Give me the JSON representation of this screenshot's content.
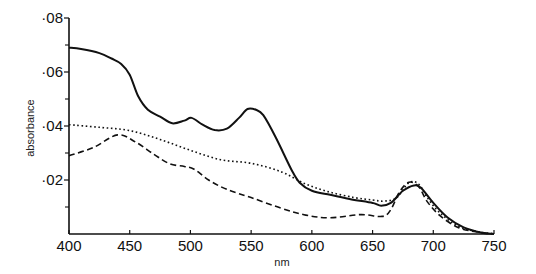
{
  "chart_data": {
    "type": "line",
    "title": "",
    "xlabel": "nm",
    "ylabel": "absorbance",
    "xlim": [
      400,
      750
    ],
    "ylim": [
      0,
      0.08
    ],
    "x_ticks": [
      400,
      450,
      500,
      550,
      600,
      650,
      700,
      750
    ],
    "x_tick_labels": [
      "400",
      "450",
      "500",
      "550",
      "600",
      "650",
      "700",
      "750"
    ],
    "y_ticks": [
      0.02,
      0.04,
      0.06,
      0.08
    ],
    "y_tick_labels": [
      "·02",
      "·04",
      "·06",
      "·08"
    ],
    "y_minor_ticks": [
      0.01,
      0.03,
      0.05,
      0.07
    ],
    "grid": false,
    "legend": null,
    "series": [
      {
        "name": "solid",
        "style": "solid",
        "x": [
          400,
          410,
          425,
          435,
          443,
          450,
          457,
          465,
          475,
          485,
          495,
          501,
          510,
          520,
          530,
          540,
          547,
          554,
          560,
          570,
          583,
          590,
          600,
          615,
          631,
          650,
          657,
          665,
          675,
          684,
          690,
          700,
          712,
          725,
          740,
          750
        ],
        "values": [
          0.069,
          0.0685,
          0.067,
          0.065,
          0.063,
          0.059,
          0.051,
          0.046,
          0.0435,
          0.041,
          0.042,
          0.043,
          0.0405,
          0.0385,
          0.039,
          0.043,
          0.0463,
          0.046,
          0.044,
          0.036,
          0.024,
          0.019,
          0.016,
          0.0145,
          0.013,
          0.0115,
          0.0105,
          0.0115,
          0.016,
          0.018,
          0.017,
          0.0115,
          0.006,
          0.0025,
          0.0005,
          0.0
        ]
      },
      {
        "name": "dotted",
        "style": "dotted",
        "x": [
          400,
          425,
          450,
          475,
          500,
          525,
          550,
          575,
          595,
          615,
          635,
          650,
          660,
          670,
          680,
          688,
          695,
          705,
          720,
          735,
          750
        ],
        "values": [
          0.0405,
          0.0395,
          0.0383,
          0.035,
          0.031,
          0.0275,
          0.0262,
          0.023,
          0.0185,
          0.0155,
          0.0135,
          0.0126,
          0.0122,
          0.0135,
          0.019,
          0.0185,
          0.0135,
          0.008,
          0.003,
          0.001,
          0.0
        ]
      },
      {
        "name": "dashed",
        "style": "dashed",
        "x": [
          400,
          420,
          440,
          455,
          470,
          483,
          495,
          503,
          515,
          530,
          550,
          575,
          595,
          615,
          640,
          658,
          665,
          672,
          680,
          688,
          695,
          705,
          720,
          735,
          750
        ],
        "values": [
          0.029,
          0.032,
          0.0367,
          0.034,
          0.0295,
          0.026,
          0.025,
          0.024,
          0.02,
          0.0165,
          0.0135,
          0.0095,
          0.007,
          0.006,
          0.0072,
          0.0065,
          0.009,
          0.0155,
          0.0192,
          0.0175,
          0.012,
          0.007,
          0.0025,
          0.0008,
          0.0
        ]
      }
    ]
  },
  "colors": {
    "ink": "#111111",
    "background": "#ffffff"
  }
}
